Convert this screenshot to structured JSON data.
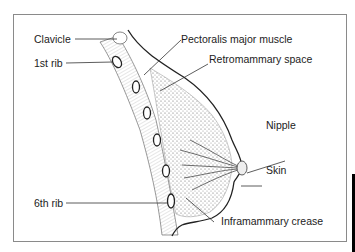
{
  "diagram": {
    "labels": {
      "clavicle": "Clavicle",
      "first_rib": "1st rib",
      "sixth_rib": "6th rib",
      "pectoralis": "Pectoralis major muscle",
      "retromammary": "Retromammary space",
      "nipple": "Nipple",
      "skin": "Skin",
      "inframammary": "Inframammary crease"
    },
    "colors": {
      "line": "#333333",
      "frame": "#8a8a8a",
      "tissue": "#555555"
    }
  }
}
